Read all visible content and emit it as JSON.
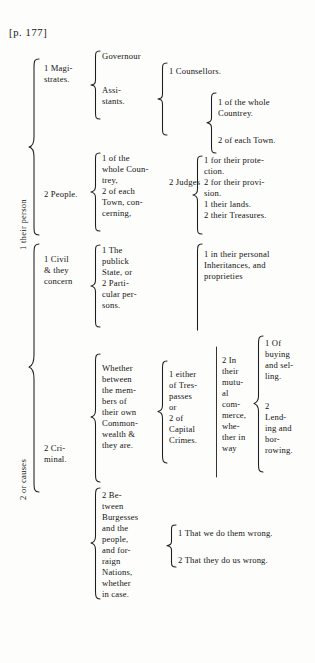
{
  "page": {
    "header": "[p. 177]",
    "type": "brace-outline-diagram"
  },
  "level1": {
    "person": "1 their person",
    "causes": "2 or causes"
  },
  "level2": {
    "magistrates": "1 Magi-\nstrates.",
    "people": "2 People.",
    "civil": "1 Civil\n& they\nconcern",
    "criminal": "2 Cri-\nminal."
  },
  "level3": {
    "governour": "Governour",
    "assistants": "Assi-\nstants.",
    "people_of_country": "1 of the\nwhole Coun-\ntrey,\n2 of each\nTown, con-\ncerning,",
    "civil_subjects": "1 The\npublick\nState, or\n2 Parti-\ncular per-\nsons.",
    "whether_between": "Whether\nbetween\nthe mem-\nbers of\ntheir own\nCommon-\nwealth &\nthey are.",
    "between_burgesses": "2 Be-\ntween\nBurgesses\nand the\npeople,\nand for-\nraign\nNations,\nwhether\nin case."
  },
  "level4": {
    "counsellors": "1 Counsellors.",
    "judges": "2 Judges",
    "people_concerns": "1 for their prote-\nction.\n2 for their provi-\nsion.\n1 their lands.\n2 their Treasures.",
    "civil_personal": "1 in their personal\nInheritances, and\nproprieties",
    "trespasses": "1 either\nof Tres-\npasses\n   or\n2 of\nCapital\nCrimes.",
    "mutual_commerce": "2 In\ntheir\nmutu-\nal\ncom-\nmerce,\nwhe-\nther in\nway",
    "burgess_wrongs_1": "1 That we do them wrong.",
    "burgess_wrongs_2": "2 That they do us wrong."
  },
  "level5": {
    "judges_country": "1 of the whole\nCountrey.",
    "judges_town": "2 of each Town.",
    "buying_selling": "1 Of\nbuying\nand sel-\nling.",
    "lending_borrowing": "2\nLend-\ning and\nbor-\nrowing."
  },
  "colors": {
    "ink": "#141414",
    "paper": "#fdfdfb"
  }
}
